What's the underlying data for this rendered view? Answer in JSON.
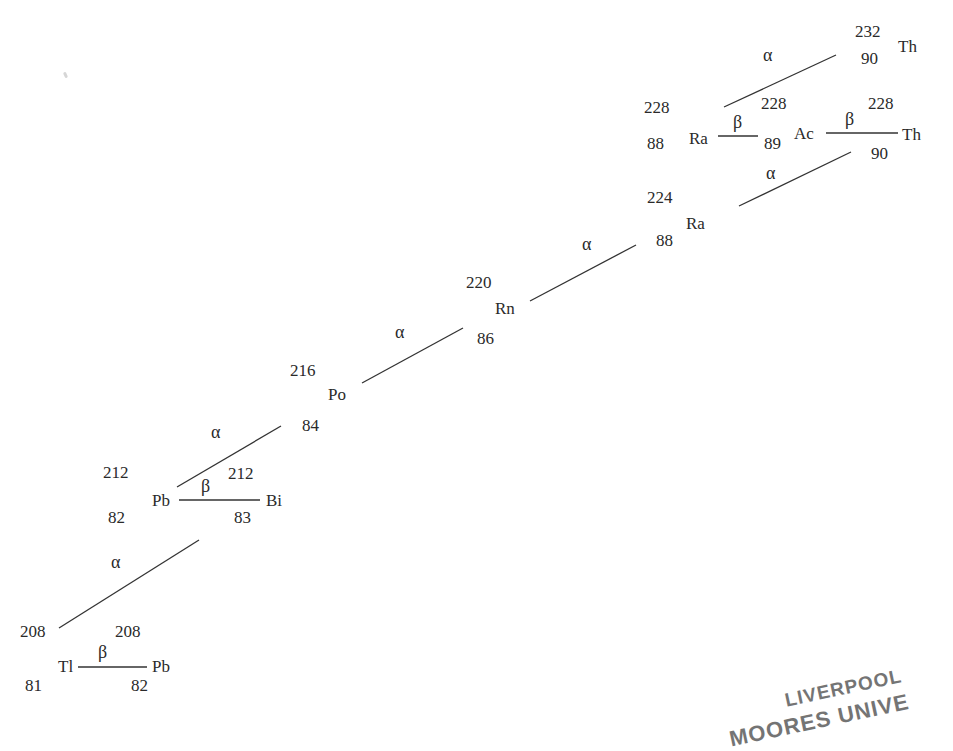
{
  "diagram": {
    "line_color": "#333333",
    "text_color": "#2a2a2a",
    "nuclides": [
      {
        "id": "th232",
        "symbol": "Th",
        "mass": "232",
        "atomic": "90"
      },
      {
        "id": "ra228",
        "symbol": "Ra",
        "mass": "228",
        "atomic": "88"
      },
      {
        "id": "ac228",
        "symbol": "Ac",
        "mass": "228",
        "atomic": "89"
      },
      {
        "id": "th228",
        "symbol": "Th",
        "mass": "228",
        "atomic": "90"
      },
      {
        "id": "ra224",
        "symbol": "Ra",
        "mass": "224",
        "atomic": "88"
      },
      {
        "id": "rn220",
        "symbol": "Rn",
        "mass": "220",
        "atomic": "86"
      },
      {
        "id": "po216",
        "symbol": "Po",
        "mass": "216",
        "atomic": "84"
      },
      {
        "id": "pb212",
        "symbol": "Pb",
        "mass": "212",
        "atomic": "82"
      },
      {
        "id": "bi212",
        "symbol": "Bi",
        "mass": "212",
        "atomic": "83"
      },
      {
        "id": "tl208",
        "symbol": "Tl",
        "mass": "208",
        "atomic": "81"
      },
      {
        "id": "pb208",
        "symbol": "Pb",
        "mass": "208",
        "atomic": "82"
      }
    ],
    "decays": [
      {
        "from": "Th-232",
        "to": "Ra-228",
        "type": "α"
      },
      {
        "from": "Ra-228",
        "to": "Ac-228",
        "type": "β"
      },
      {
        "from": "Ac-228",
        "to": "Th-228",
        "type": "β"
      },
      {
        "from": "Th-228",
        "to": "Ra-224",
        "type": "α"
      },
      {
        "from": "Ra-224",
        "to": "Rn-220",
        "type": "α"
      },
      {
        "from": "Rn-220",
        "to": "Po-216",
        "type": "α"
      },
      {
        "from": "Po-216",
        "to": "Pb-212",
        "type": "α"
      },
      {
        "from": "Pb-212",
        "to": "Bi-212",
        "type": "β"
      },
      {
        "from": "Bi-212",
        "to": "Tl-208",
        "type": "α"
      },
      {
        "from": "Tl-208",
        "to": "Pb-208",
        "type": "β"
      }
    ],
    "labels": {
      "alpha": "α",
      "beta": "β"
    },
    "stamp": {
      "line1": "LIVERPOOL",
      "line2": "MOORES UNIVE"
    }
  }
}
